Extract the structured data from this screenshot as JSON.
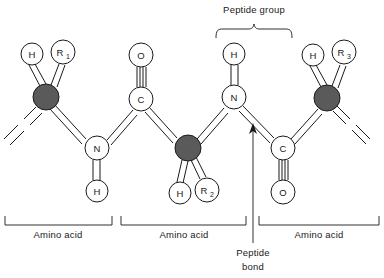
{
  "diagram": {
    "type": "molecular-structure",
    "background_color": "#ffffff",
    "stroke_color": "#1a1a1a",
    "alpha_carbon_fill": "#5a5a5a",
    "backbone_atom_fill": "#ffffff"
  },
  "annotations": {
    "peptide_group": "Peptide group",
    "peptide_bond_line1": "Peptide",
    "peptide_bond_line2": "bond"
  },
  "residue_labels": [
    {
      "text": "Amino acid"
    },
    {
      "text": "Amino acid"
    },
    {
      "text": "Amino acid"
    }
  ],
  "atoms": [
    {
      "id": "ca1",
      "label": "",
      "sub": "",
      "kind": "alpha-carbon",
      "cx": 46,
      "cy": 97,
      "r": 13
    },
    {
      "id": "h1",
      "label": "H",
      "sub": "",
      "kind": "hydrogen",
      "cx": 32,
      "cy": 54,
      "r": 11
    },
    {
      "id": "r1",
      "label": "R",
      "sub": "1",
      "kind": "side-chain",
      "cx": 63,
      "cy": 52,
      "r": 12
    },
    {
      "id": "n1",
      "label": "N",
      "sub": "",
      "kind": "nitrogen",
      "cx": 97,
      "cy": 148,
      "r": 12
    },
    {
      "id": "h2",
      "label": "H",
      "sub": "",
      "kind": "hydrogen",
      "cx": 97,
      "cy": 191,
      "r": 11
    },
    {
      "id": "c1",
      "label": "C",
      "sub": "",
      "kind": "carbon",
      "cx": 141,
      "cy": 99,
      "r": 12
    },
    {
      "id": "o1",
      "label": "O",
      "sub": "",
      "kind": "oxygen",
      "cx": 141,
      "cy": 55,
      "r": 12
    },
    {
      "id": "ca2",
      "label": "",
      "sub": "",
      "kind": "alpha-carbon",
      "cx": 188,
      "cy": 148,
      "r": 13
    },
    {
      "id": "h3",
      "label": "H",
      "sub": "",
      "kind": "hydrogen",
      "cx": 180,
      "cy": 193,
      "r": 11
    },
    {
      "id": "r2",
      "label": "R",
      "sub": "2",
      "kind": "side-chain",
      "cx": 207,
      "cy": 190,
      "r": 12
    },
    {
      "id": "n2",
      "label": "N",
      "sub": "",
      "kind": "nitrogen",
      "cx": 234,
      "cy": 97,
      "r": 12
    },
    {
      "id": "h4",
      "label": "H",
      "sub": "",
      "kind": "hydrogen",
      "cx": 234,
      "cy": 54,
      "r": 11
    },
    {
      "id": "c2",
      "label": "C",
      "sub": "",
      "kind": "carbon",
      "cx": 283,
      "cy": 148,
      "r": 12
    },
    {
      "id": "o2",
      "label": "O",
      "sub": "",
      "kind": "oxygen",
      "cx": 283,
      "cy": 192,
      "r": 12
    },
    {
      "id": "ca3",
      "label": "",
      "sub": "",
      "kind": "alpha-carbon",
      "cx": 327,
      "cy": 98,
      "r": 13
    },
    {
      "id": "h5",
      "label": "H",
      "sub": "",
      "kind": "hydrogen",
      "cx": 313,
      "cy": 55,
      "r": 11
    },
    {
      "id": "r3",
      "label": "R",
      "sub": "3",
      "kind": "side-chain",
      "cx": 344,
      "cy": 52,
      "r": 12
    }
  ]
}
